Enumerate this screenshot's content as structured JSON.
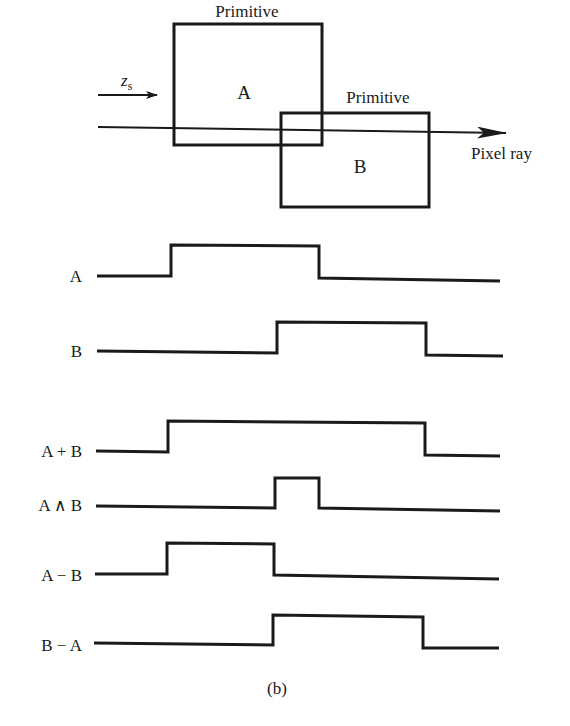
{
  "figure": {
    "caption": "(b)",
    "top_diagram": {
      "primitive_a": {
        "label": "Primitive",
        "letter": "A"
      },
      "primitive_b": {
        "label": "Primitive",
        "letter": "B"
      },
      "direction_label": "z",
      "direction_subscript": "s",
      "ray_label": "Pixel ray"
    },
    "signals": [
      {
        "label": "A",
        "high_intervals": [
          [
            171,
            319
          ]
        ]
      },
      {
        "label": "B",
        "high_intervals": [
          [
            277,
            426
          ]
        ]
      },
      {
        "label": "A + B",
        "high_intervals": [
          [
            169,
            425
          ]
        ]
      },
      {
        "label": "A ∧ B",
        "high_intervals": [
          [
            275,
            319
          ]
        ]
      },
      {
        "label": "A − B",
        "high_intervals": [
          [
            167,
            274
          ]
        ]
      },
      {
        "label": "B − A",
        "high_intervals": [
          [
            273,
            424
          ]
        ]
      }
    ],
    "colors": {
      "ink": "#1a1a1a",
      "paper": "#ffffff"
    }
  }
}
